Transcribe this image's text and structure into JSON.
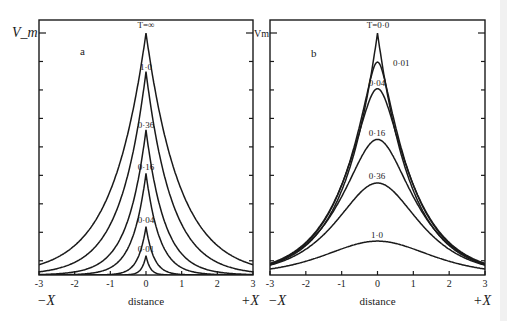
{
  "chart_data": [
    {
      "type": "line",
      "panel_label": "a",
      "ylabel": "V_m",
      "xlabel": "distance",
      "x_left_label": "−X",
      "x_right_label": "+X",
      "xlim": [
        -3,
        3
      ],
      "x_ticks": [
        "-3",
        "-2",
        "-1",
        "0",
        "1",
        "2",
        "3"
      ],
      "ylim": [
        0,
        1
      ],
      "y_ticks_count": 9,
      "grid": false,
      "legend": "inline curve labels",
      "series": [
        {
          "name": "T=∞",
          "label": "T=∞",
          "peak": 1.0,
          "decay": 0.95,
          "shape": "cusp"
        },
        {
          "name": "T=1·0",
          "label": "1·0",
          "peak": 0.84,
          "decay": 0.72,
          "shape": "cusp"
        },
        {
          "name": "T=0·36",
          "label": "0·36",
          "peak": 0.6,
          "decay": 0.52,
          "shape": "cusp"
        },
        {
          "name": "T=0·16",
          "label": "0·16",
          "peak": 0.42,
          "decay": 0.38,
          "shape": "cusp"
        },
        {
          "name": "T=0·04",
          "label": "0·04",
          "peak": 0.2,
          "decay": 0.22,
          "shape": "cusp"
        },
        {
          "name": "T=0·01",
          "label": "0·01",
          "peak": 0.08,
          "decay": 0.12,
          "shape": "cusp"
        }
      ]
    },
    {
      "type": "line",
      "panel_label": "b",
      "ylabel": "Vm",
      "xlabel": "distance",
      "x_left_label": "−X",
      "x_right_label": "+X",
      "xlim": [
        -3,
        3
      ],
      "x_ticks": [
        "-3",
        "-2",
        "-1",
        "0",
        "1",
        "2",
        "3"
      ],
      "ylim": [
        0,
        1
      ],
      "y_ticks_count": 9,
      "grid": false,
      "legend": "inline curve labels",
      "series": [
        {
          "name": "T=0·0",
          "label": "T=0·0",
          "peak": 1.0,
          "decay": 0.95,
          "shape": "cusp"
        },
        {
          "name": "T=0·01",
          "label": "0·01",
          "peak": 0.88,
          "spread": 0.2
        },
        {
          "name": "T=0·04",
          "label": "0·04",
          "peak": 0.77,
          "spread": 0.38
        },
        {
          "name": "T=0·16",
          "label": "0·16",
          "peak": 0.56,
          "spread": 0.7
        },
        {
          "name": "T=0·36",
          "label": "0·36",
          "peak": 0.38,
          "spread": 1.05
        },
        {
          "name": "T=1·0",
          "label": "1·0",
          "peak": 0.14,
          "spread": 1.9
        }
      ]
    }
  ]
}
